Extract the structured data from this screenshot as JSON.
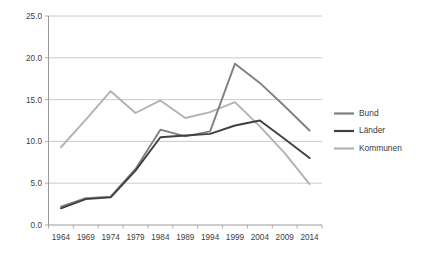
{
  "chart_data": {
    "type": "line",
    "title": "",
    "subtitle": "",
    "xlabel": "",
    "ylabel": "",
    "categories": [
      "1964",
      "1969",
      "1974",
      "1979",
      "1984",
      "1989",
      "1994",
      "1999",
      "2004",
      "2009",
      "2014"
    ],
    "x": [
      1964,
      1969,
      1974,
      1979,
      1984,
      1989,
      1994,
      1999,
      2004,
      2009,
      2014
    ],
    "ylim": [
      0.0,
      25.0
    ],
    "yticks": [
      "0.0",
      "5.0",
      "10.0",
      "15.0",
      "20.0",
      "25.0"
    ],
    "ytick_values": [
      0.0,
      5.0,
      10.0,
      15.0,
      20.0,
      25.0
    ],
    "grid": true,
    "legend_position": "right",
    "series": [
      {
        "name": "Bund",
        "color": "#808080",
        "values": [
          2.2,
          3.2,
          3.4,
          6.7,
          11.4,
          10.6,
          11.2,
          19.3,
          17.0,
          14.2,
          11.3
        ]
      },
      {
        "name": "Länder",
        "color": "#404040",
        "values": [
          2.0,
          3.1,
          3.3,
          6.5,
          10.5,
          10.7,
          10.9,
          11.9,
          12.5,
          10.3,
          8.0
        ]
      },
      {
        "name": "Kommunen",
        "color": "#b3b3b3",
        "values": [
          9.3,
          12.6,
          16.0,
          13.4,
          14.9,
          12.8,
          13.5,
          14.7,
          11.8,
          8.6,
          4.9
        ]
      }
    ]
  },
  "legend": {
    "entries": [
      {
        "label": "Bund"
      },
      {
        "label": "Länder"
      },
      {
        "label": "Kommunen"
      }
    ]
  }
}
